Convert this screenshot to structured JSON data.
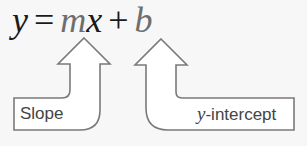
{
  "equation": {
    "lhs": "y",
    "equals": "=",
    "m": "m",
    "x": "x",
    "plus": "+",
    "b": "b"
  },
  "labels": {
    "slope": "Slope",
    "intercept_var": "y",
    "intercept_rest": "-intercept"
  },
  "colors": {
    "text": "#1a1a1a",
    "highlight": "#6e6e6e",
    "arrow_stroke": "#7a7a7a",
    "arrow_fill": "#ffffff",
    "background": "#f7f7f7"
  }
}
